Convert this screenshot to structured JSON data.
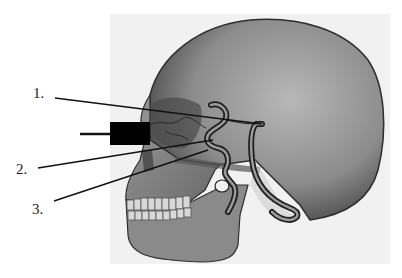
{
  "figure": {
    "panel_background": "#f1f1f1",
    "bone_color": "#8f8f8f",
    "artery_color": "#2a2a2a",
    "redaction_color": "#000000"
  },
  "labels": [
    {
      "id": "1",
      "text": "1.",
      "x": 33,
      "y": 86
    },
    {
      "id": "2",
      "text": "2.",
      "x": 16,
      "y": 162
    },
    {
      "id": "3",
      "text": "3.",
      "x": 32,
      "y": 202
    }
  ],
  "leader_lines": [
    {
      "for": "1",
      "x1": 55,
      "y1": 98,
      "x2": 262,
      "y2": 124
    },
    {
      "for": "2",
      "x1": 38,
      "y1": 168,
      "x2": 213,
      "y2": 140
    },
    {
      "for": "3",
      "x1": 54,
      "y1": 201,
      "x2": 208,
      "y2": 150
    },
    {
      "for": "redacted",
      "x1": 80,
      "y1": 134,
      "x2": 110,
      "y2": 134
    }
  ],
  "redacted_box": {
    "x": 110,
    "y": 122,
    "width": 40,
    "height": 23
  }
}
